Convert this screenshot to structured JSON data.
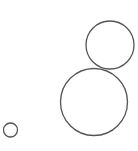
{
  "diagram": {
    "type": "circles",
    "stroke_color": "#555555",
    "background_color": "#ffffff",
    "shapes": [
      {
        "name": "circle-top-right",
        "size": "medium"
      },
      {
        "name": "circle-large",
        "size": "large"
      },
      {
        "name": "circle-small",
        "size": "small"
      }
    ]
  }
}
